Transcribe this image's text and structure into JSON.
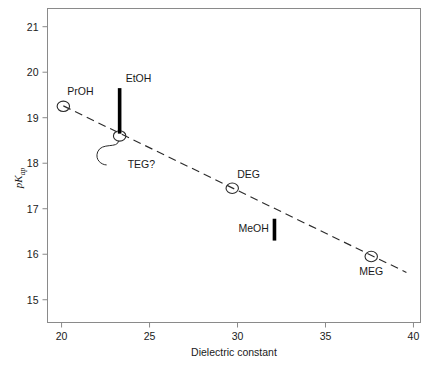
{
  "chart_data": {
    "type": "scatter",
    "title": "",
    "xlabel": "Dielectric constant",
    "ylabel": "pKap",
    "ylabel_main": "pK",
    "ylabel_sub": "ap",
    "xlim": [
      19.2,
      40.4
    ],
    "ylim": [
      14.5,
      21.4
    ],
    "xticks": [
      20,
      25,
      30,
      35,
      40
    ],
    "yticks": [
      15,
      16,
      17,
      18,
      19,
      20,
      21
    ],
    "xtick_labels": [
      "20",
      "25",
      "30",
      "35",
      "40"
    ],
    "ytick_labels": [
      "15",
      "16",
      "17",
      "18",
      "19",
      "20",
      "21"
    ],
    "grid": false,
    "legend": "none",
    "marker_style": "open-circle",
    "points": [
      {
        "label": "PrOH",
        "x": 20.1,
        "y": 19.25,
        "marker": "circle",
        "label_dx": 4,
        "label_dy": -11
      },
      {
        "label": "TEG?",
        "x": 23.3,
        "y": 18.6,
        "marker": "circle",
        "label_dx": 8,
        "label_dy": 32,
        "leader": true
      },
      {
        "label": "DEG",
        "x": 29.7,
        "y": 17.45,
        "marker": "circle",
        "label_dx": 5,
        "label_dy": -10
      },
      {
        "label": "MEG",
        "x": 37.6,
        "y": 15.95,
        "marker": "circle",
        "label_dx": -12,
        "label_dy": 18
      }
    ],
    "bars": [
      {
        "label": "EtOH",
        "x": 23.3,
        "y_low": 18.65,
        "y_high": 19.65,
        "label_dx": 6,
        "label_dy": -6
      },
      {
        "label": "MeOH",
        "x": 32.1,
        "y_low": 16.3,
        "y_high": 16.78,
        "label_dx": -36,
        "label_dy": 13
      }
    ],
    "trendline": {
      "x1": 20.1,
      "y1": 19.26,
      "x2": 39.6,
      "y2": 15.6,
      "style": "dashed"
    },
    "colors": {
      "frame": "#8a8a8a",
      "ink": "#2b2b2b",
      "bar": "#000000",
      "background": "#ffffff"
    }
  }
}
